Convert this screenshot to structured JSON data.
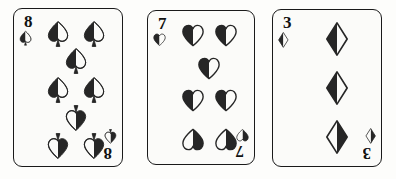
{
  "scene": {
    "description": "Three playing cards laid side by side on a white surface",
    "background_color": "#fdfdfb",
    "card_face_color": "#fbfbf9",
    "card_border_color": "#1a1a1a",
    "pip_dark_color": "#262626",
    "pip_light_color": "#fbfbf9",
    "rank_color": "#111111",
    "card_count": 3
  },
  "cards": [
    {
      "id": "card-8-of-spades",
      "rank": "8",
      "rank_label": "8",
      "suit": "spades",
      "suit_name": "Spades",
      "suit_symbol": "♠",
      "color": "black",
      "pip_count": 8,
      "name": "Eight of Spades",
      "geometry": {
        "left": 13,
        "top": 8,
        "width": 110,
        "height": 159
      },
      "pip_layout": [
        {
          "x": 28,
          "y": 13,
          "flip": false
        },
        {
          "x": 72,
          "y": 13,
          "flip": false
        },
        {
          "x": 50,
          "y": 32,
          "flip": false
        },
        {
          "x": 28,
          "y": 52,
          "flip": false
        },
        {
          "x": 72,
          "y": 52,
          "flip": false
        },
        {
          "x": 50,
          "y": 71,
          "flip": true
        },
        {
          "x": 28,
          "y": 90,
          "flip": true
        },
        {
          "x": 72,
          "y": 90,
          "flip": true
        }
      ]
    },
    {
      "id": "card-7-of-hearts",
      "rank": "7",
      "rank_label": "7",
      "suit": "hearts",
      "suit_name": "Hearts",
      "suit_symbol": "♥",
      "color": "black",
      "pip_count": 7,
      "name": "Seven of Hearts",
      "geometry": {
        "left": 147,
        "top": 10,
        "width": 108,
        "height": 155
      },
      "pip_layout": [
        {
          "x": 29,
          "y": 13,
          "flip": false
        },
        {
          "x": 72,
          "y": 13,
          "flip": false
        },
        {
          "x": 50,
          "y": 36,
          "flip": false
        },
        {
          "x": 29,
          "y": 59,
          "flip": false
        },
        {
          "x": 72,
          "y": 59,
          "flip": false
        },
        {
          "x": 29,
          "y": 87,
          "flip": true
        },
        {
          "x": 72,
          "y": 87,
          "flip": true
        }
      ]
    },
    {
      "id": "card-3-of-diamonds",
      "rank": "3",
      "rank_label": "3",
      "suit": "diamonds",
      "suit_name": "Diamonds",
      "suit_symbol": "♦",
      "color": "black",
      "pip_count": 3,
      "name": "Three of Diamonds",
      "geometry": {
        "left": 272,
        "top": 9,
        "width": 110,
        "height": 158
      },
      "pip_layout": [
        {
          "x": 52,
          "y": 16,
          "flip": false
        },
        {
          "x": 52,
          "y": 50,
          "flip": false
        },
        {
          "x": 52,
          "y": 84,
          "flip": true
        }
      ]
    }
  ]
}
